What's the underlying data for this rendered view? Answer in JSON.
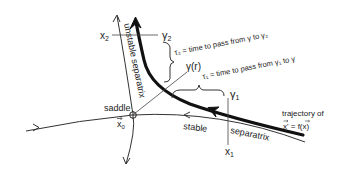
{
  "diagram": {
    "labels": {
      "saddle": "saddle",
      "x0": "x",
      "x0_sub": "0",
      "x1": "x",
      "x1_sub": "1",
      "x2": "x",
      "x2_sub": "2",
      "gamma1": "γ",
      "gamma1_sub": "1",
      "gamma2": "γ",
      "gamma2_sub": "2",
      "gamma_r": "γ(r)",
      "unstable_separatrix": "unstable separatrix",
      "stable_separatrix_1": "stable",
      "stable_separatrix_2": "separatrix",
      "trajectory_line1": "trajectory of",
      "trajectory_line2": "x' = f(x)",
      "tau2": "τ₂ = time to pass from γ to γ₂",
      "tau1": "τ₁ = time to pass from γ₁ to γ"
    },
    "colors": {
      "ink": "#222222",
      "background": "#ffffff"
    }
  }
}
